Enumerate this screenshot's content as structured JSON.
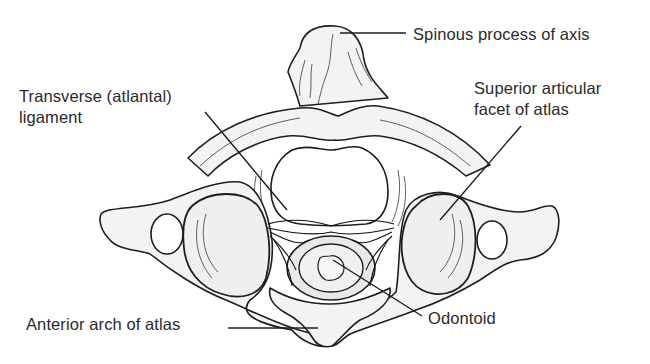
{
  "figure": {
    "labels": {
      "spinous_process": "Spinous process of axis",
      "transverse_ligament_line1": "Transverse (atlantal)",
      "transverse_ligament_line2": "ligament",
      "superior_facet_line1": "Superior articular",
      "superior_facet_line2": "facet of atlas",
      "anterior_arch": "Anterior arch of atlas",
      "odontoid": "Odontoid"
    },
    "colors": {
      "background": "#ffffff",
      "ink": "#1e1e1e",
      "bone_fill": "#f3f3f3",
      "text": "#2a2a2a"
    }
  }
}
